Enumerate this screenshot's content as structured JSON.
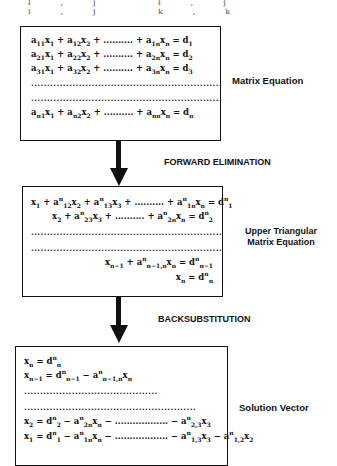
{
  "top_fragment": "i,j i,j i,j k,k",
  "box1": {
    "label": "Matrix  Equation",
    "rows": [
      {
        "id": "r1",
        "html": "a<sub>11</sub>x<sub>1</sub> + a<sub>12</sub>x<sub>2</sub> + .......... + a<sub>1n</sub>x<sub>n</sub> = d<sub>1</sub>"
      },
      {
        "id": "r2",
        "html": "a<sub>21</sub>x<sub>1</sub> + a<sub>22</sub>x<sub>2</sub> + .......... + a<sub>2n</sub>x<sub>n</sub> = d<sub>2</sub>"
      },
      {
        "id": "r3",
        "html": "a<sub>31</sub>x<sub>1</sub> + a<sub>32</sub>x<sub>2</sub> + .......... + a<sub>3n</sub>x<sub>n</sub> = d<sub>3</sub>"
      },
      {
        "id": "rn",
        "html": "a<sub>n1</sub>x<sub>1</sub> + a<sub>n2</sub>x<sub>2</sub> + .......... + a<sub>nn</sub>x<sub>n</sub> = d<sub>n</sub>"
      }
    ],
    "dots": "............................................................"
  },
  "step1": "FORWARD ELIMINATION",
  "box2": {
    "label_line1": "Upper Triangular",
    "label_line2": "Matrix Equation",
    "rows": [
      {
        "id": "u1",
        "html": "x<sub>1</sub> + a<sup>n</sup><sub>12</sub>x<sub>2</sub> + a<sup>n</sup><sub>13</sub>x<sub>3</sub> + .......... + a<sup>n</sup><sub>1n</sub>x<sub>n</sub> = d<sup>n</sup><sub>1</sub>"
      },
      {
        "id": "u2",
        "html": "x<sub>2</sub> + a<sup>n</sup><sub>23</sub>x<sub>3</sub> + .......... + a<sup>n</sup><sub>2n</sub>x<sub>n</sub> = d<sup>n</sup><sub>2</sub>"
      },
      {
        "id": "un1",
        "html": "x<sub>n−1</sub> + a<sup>n</sup><sub>n−1,n</sub>x<sub>n</sub> = d<sup>n</sup><sub>n−1</sub>"
      },
      {
        "id": "un",
        "html": "x<sub>n</sub> = d<sup>n</sup><sub>n</sub>"
      }
    ],
    "dots": "............................................................"
  },
  "step2": "BACKSUBSTITUTION",
  "box3": {
    "label": "Solution Vector",
    "rows": [
      {
        "id": "s1",
        "html": "x<sub>n</sub> = d<sup>n</sup><sub>n</sub>"
      },
      {
        "id": "s2",
        "html": "x<sub>n−1</sub> = d<sup>n</sup><sub>n−1</sub> − a<sup>n</sup><sub>n−1,n</sub>x<sub>n</sub>"
      },
      {
        "id": "s3",
        "html": "x<sub>2</sub> = d<sup>n</sup><sub>2</sub> − a<sup>n</sup><sub>2n</sub>x<sub>n</sub> − .................. − a<sup>n</sup><sub>2,3</sub>x<sub>3</sub>"
      },
      {
        "id": "s4",
        "html": "x<sub>1</sub> = d<sup>n</sup><sub>1</sub> − a<sup>n</sup><sub>1n</sub>x<sub>n</sub> − .................. − a<sup>n</sup><sub>1,3</sub>x<sub>3</sub> − a<sup>n</sup><sub>1,2</sub>x<sub>2</sub>"
      }
    ],
    "dots_short": "..........................................",
    "dots_long": "......................................................"
  }
}
